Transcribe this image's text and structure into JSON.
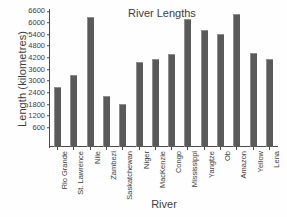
{
  "chart_data": {
    "type": "bar",
    "title": "River  Lengths",
    "xlabel": "River",
    "ylabel": "Length (kilometres)",
    "categories": [
      "Rio Grande",
      "St. Lawrence",
      "Nile",
      "Zambezi",
      "Saskatchewan",
      "Niger",
      "MacKenzie",
      "Congo",
      "Mississippi",
      "Yangtze",
      "Ob",
      "Amazon",
      "Yellow",
      "Lena"
    ],
    "values": [
      3100,
      3700,
      6700,
      2650,
      2200,
      4370,
      4530,
      4800,
      6600,
      6000,
      5840,
      6870,
      4860,
      4530
    ],
    "ylim": [
      0,
      7050
    ],
    "yticks": [
      600,
      1200,
      1800,
      2400,
      3000,
      3600,
      4200,
      4800,
      5400,
      6000,
      6600
    ],
    "ytick_labels": [
      "600",
      "1200",
      "1800",
      "2400",
      "3000",
      "3600",
      "4200",
      "4800",
      "5400",
      "6000",
      "6600"
    ],
    "grid": false,
    "legend": false,
    "bar_color": "#5a5a5a",
    "axis_color": "#4a4a4a"
  }
}
